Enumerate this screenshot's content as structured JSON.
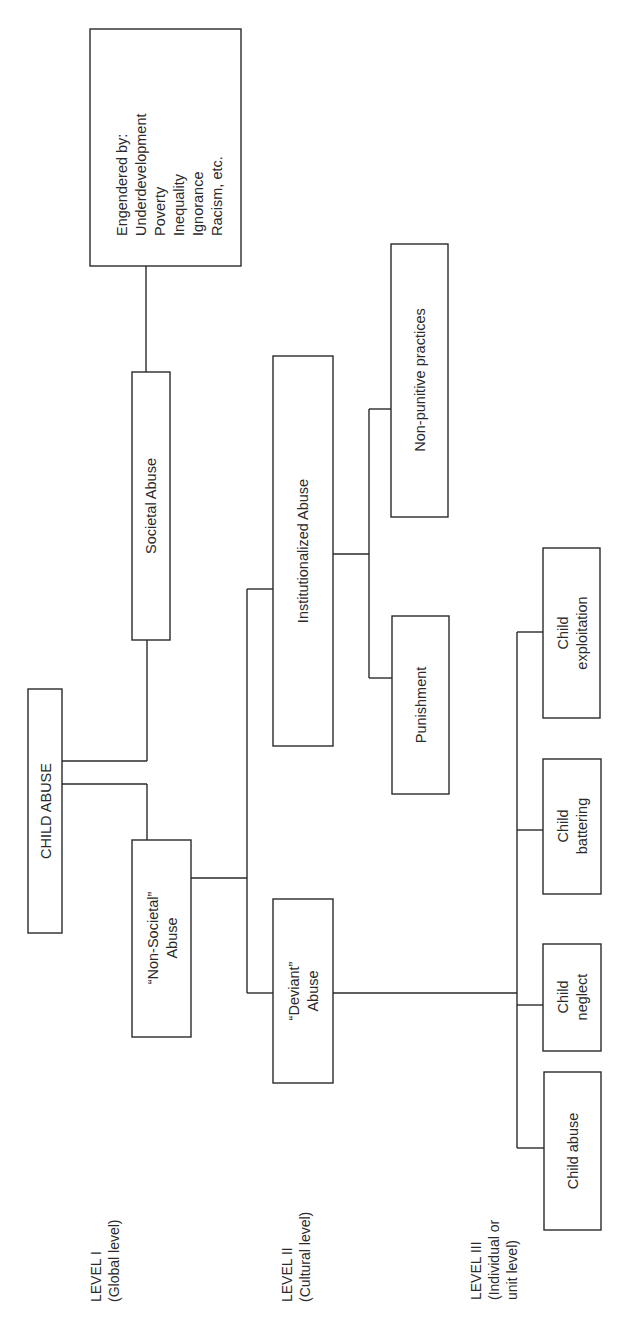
{
  "diagram": {
    "orientation": "rotated 90 degrees counter-clockwise",
    "root": {
      "label": "CHILD ABUSE"
    },
    "level_labels": [
      {
        "line1": "LEVEL I",
        "line2": "(Global level)"
      },
      {
        "line1": "LEVEL II",
        "line2": "(Cultural level)"
      },
      {
        "line1": "LEVEL III",
        "line2": "(Individual or",
        "line3": "unit level)"
      }
    ],
    "nodes": {
      "societal": {
        "label": "Societal Abuse"
      },
      "engendered": {
        "lines": [
          "Engendered by:",
          "Underdevelopment",
          "Poverty",
          "Inequality",
          "Ignorance",
          "Racism, etc."
        ]
      },
      "non_societal": {
        "line1": "“Non-Societal”",
        "line2": "Abuse"
      },
      "institutionalized": {
        "label": "Institutionalized Abuse"
      },
      "non_punitive": {
        "label": "Non-punitive practices"
      },
      "punishment": {
        "label": "Punishment"
      },
      "deviant": {
        "line1": "“Deviant”",
        "line2": "Abuse"
      },
      "child_exploitation": {
        "line1": "Child",
        "line2": "exploitation"
      },
      "child_battering": {
        "line1": "Child",
        "line2": "battering"
      },
      "child_neglect": {
        "line1": "Child",
        "line2": "neglect"
      },
      "child_abuse_leaf": {
        "label": "Child abuse"
      }
    },
    "edges": [
      [
        "CHILD ABUSE",
        "Societal Abuse"
      ],
      [
        "CHILD ABUSE",
        "Non-Societal Abuse"
      ],
      [
        "Societal Abuse",
        "Engendered by"
      ],
      [
        "Non-Societal Abuse",
        "Institutionalized Abuse"
      ],
      [
        "Non-Societal Abuse",
        "Deviant Abuse"
      ],
      [
        "Institutionalized Abuse",
        "Non-punitive practices"
      ],
      [
        "Institutionalized Abuse",
        "Punishment"
      ],
      [
        "Deviant Abuse",
        "Child exploitation"
      ],
      [
        "Deviant Abuse",
        "Child battering"
      ],
      [
        "Deviant Abuse",
        "Child neglect"
      ],
      [
        "Deviant Abuse",
        "Child abuse"
      ]
    ]
  }
}
